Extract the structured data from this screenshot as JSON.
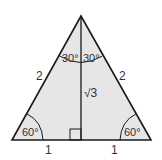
{
  "diagram": {
    "colors": {
      "fill": "#e6e6e6",
      "stroke": "#1a1a1a",
      "text": "#333333"
    },
    "labels": {
      "left_side": "2",
      "right_side": "2",
      "altitude": "√3",
      "base_left": "1",
      "base_right": "1",
      "apex_left_angle": "30°",
      "apex_right_angle": "30°",
      "base_left_angle": "60°",
      "base_right_angle": "60°"
    },
    "right_angle_marker": true
  }
}
